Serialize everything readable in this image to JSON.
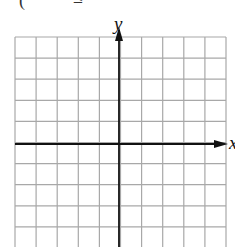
{
  "header_fragment": {
    "left_paren": "(",
    "symbol": "≤"
  },
  "graph": {
    "type": "coordinate-grid",
    "x_axis_label": "x",
    "y_axis_label": "y",
    "grid_left": 15,
    "grid_top": 37,
    "cell_size": 21.1,
    "columns": 10,
    "rows_visible": 10,
    "origin_px": [
      119,
      144
    ],
    "grid_color": "#a8a8a8",
    "axis_color": "#111111"
  }
}
